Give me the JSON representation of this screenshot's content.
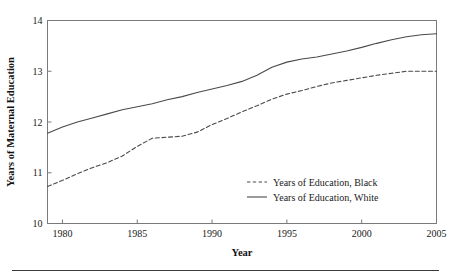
{
  "chart_data": {
    "type": "line",
    "title": "",
    "xlabel": "Year",
    "ylabel": "Years of Maternal Education",
    "xlim": [
      1979,
      2005
    ],
    "ylim": [
      10,
      14
    ],
    "grid": false,
    "legend_position": "inside-lower-right",
    "x_ticks": [
      "1980",
      "1985",
      "1990",
      "1995",
      "2000",
      "2005"
    ],
    "x_tick_values": [
      1980,
      1985,
      1990,
      1995,
      2000,
      2005
    ],
    "y_ticks": [
      "10",
      "11",
      "12",
      "13",
      "14"
    ],
    "y_tick_values": [
      10,
      11,
      12,
      13,
      14
    ],
    "x": [
      1979,
      1980,
      1981,
      1982,
      1983,
      1984,
      1985,
      1986,
      1987,
      1988,
      1989,
      1990,
      1991,
      1992,
      1993,
      1994,
      1995,
      1996,
      1997,
      1998,
      1999,
      2000,
      2001,
      2002,
      2003,
      2004,
      2005
    ],
    "series": [
      {
        "name": "Years of Education, Black",
        "style": "dashed",
        "color": "#4a4a4a",
        "values": [
          10.73,
          10.85,
          10.98,
          11.1,
          11.2,
          11.33,
          11.52,
          11.68,
          11.7,
          11.72,
          11.8,
          11.95,
          12.07,
          12.2,
          12.32,
          12.45,
          12.55,
          12.62,
          12.7,
          12.77,
          12.82,
          12.87,
          12.92,
          12.96,
          13.0,
          13.0,
          13.0
        ]
      },
      {
        "name": "Years of Education, White",
        "style": "solid",
        "color": "#4a4a4a",
        "values": [
          11.78,
          11.9,
          12.0,
          12.08,
          12.16,
          12.24,
          12.3,
          12.36,
          12.44,
          12.5,
          12.58,
          12.65,
          12.72,
          12.8,
          12.92,
          13.08,
          13.18,
          13.24,
          13.28,
          13.34,
          13.4,
          13.47,
          13.55,
          13.62,
          13.68,
          13.72,
          13.74
        ]
      }
    ]
  },
  "legend": {
    "entries": [
      {
        "label": "Years of Education, Black",
        "style": "dashed"
      },
      {
        "label": "Years of Education, White",
        "style": "solid"
      }
    ]
  },
  "axes": {
    "x_title": "Year",
    "y_title": "Years of Maternal Education"
  }
}
